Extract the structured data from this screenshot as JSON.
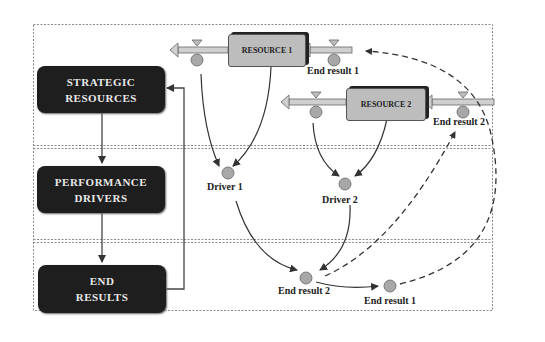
{
  "diagram": {
    "left_boxes": [
      {
        "line1": "STRATEGIC",
        "line2": "RESOURCES"
      },
      {
        "line1": "PERFORMANCE",
        "line2": "DRIVERS"
      },
      {
        "line1": "END",
        "line2": "RESULTS"
      }
    ],
    "stocks": [
      {
        "label": "RESOURCE 1"
      },
      {
        "label": "RESOURCE 2"
      }
    ],
    "flow_labels": {
      "end_result_1_top": "End result 1",
      "end_result_2_top": "End result 2"
    },
    "nodes": {
      "driver_1": "Driver 1",
      "driver_2": "Driver 2",
      "end_result_2": "End result 2",
      "end_result_1": "End result 1"
    },
    "colors": {
      "dark_box": "#1e1e1e",
      "stock_fill": "#bdbdbd",
      "node_fill": "#a8a8a8",
      "line": "#333333"
    }
  }
}
